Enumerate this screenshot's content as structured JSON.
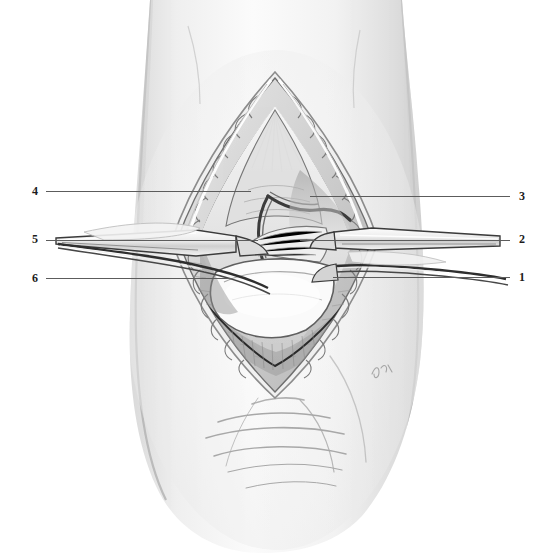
{
  "figure": {
    "background_color": "#ffffff",
    "ink_color": "#1c1c1c",
    "leader_color": "#5c5c5c",
    "style": "graphite pencil medical illustration, grayscale",
    "signature": "GK"
  },
  "labels": {
    "left": [
      {
        "number": "4",
        "num_x": 32,
        "num_y": 185,
        "line_x": 46,
        "line_y": 191,
        "line_w": 205
      },
      {
        "number": "5",
        "num_x": 32,
        "num_y": 233,
        "line_x": 46,
        "line_y": 240,
        "line_w": 212
      },
      {
        "number": "6",
        "num_x": 32,
        "num_y": 272,
        "line_x": 46,
        "line_y": 278,
        "line_w": 185
      }
    ],
    "right": [
      {
        "number": "3",
        "num_x": 519,
        "num_y": 190,
        "line_x": 310,
        "line_y": 196,
        "line_w": 200
      },
      {
        "number": "2",
        "num_x": 519,
        "num_y": 233,
        "line_x": 300,
        "line_y": 240,
        "line_w": 210
      },
      {
        "number": "1",
        "num_x": 519,
        "num_y": 271,
        "line_x": 333,
        "line_y": 277,
        "line_w": 177
      }
    ]
  },
  "regions": [
    {
      "name": "limb-silhouette",
      "description": "vertical limb segment occupying center of frame"
    },
    {
      "name": "skin-incision-opening",
      "description": "lens shaped open wound, apex superior and inferior"
    },
    {
      "name": "subcutaneous-fat-margin",
      "description": "lobulated fat along incised skin edges"
    },
    {
      "name": "exposed-joint-capsule",
      "description": "pale capsular tissue within retracted wound"
    },
    {
      "name": "retractor-left-upper",
      "description": "flat retractor blade entering from left at mid height"
    },
    {
      "name": "retractor-left-lower",
      "description": "second retractor tine below left blade"
    },
    {
      "name": "retractor-right-upper",
      "description": "flat retractor blade entering from right"
    },
    {
      "name": "retractor-right-lower",
      "description": "second retractor tine on right"
    },
    {
      "name": "skin-creases",
      "description": "transverse skin folds inferior to wound"
    }
  ]
}
